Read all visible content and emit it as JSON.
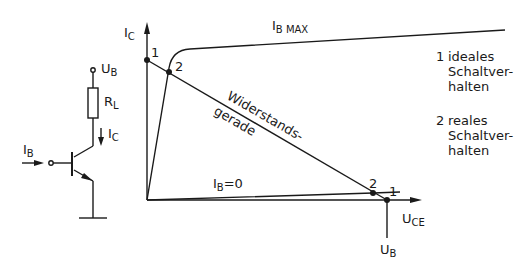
{
  "circuit": {
    "supply_label": "U",
    "supply_sub": "B",
    "resistor_label": "R",
    "resistor_sub": "L",
    "collector_current_label": "I",
    "collector_current_sub": "C",
    "base_current_label": "I",
    "base_current_sub": "B"
  },
  "graph": {
    "y_axis_label": "I",
    "y_axis_sub": "C",
    "x_axis_label": "U",
    "x_axis_sub": "CE",
    "x_marker_label": "U",
    "x_marker_sub": "B",
    "curve_max_label": "I",
    "curve_max_sub": "B MAX",
    "curve_zero_label": "I",
    "curve_zero_sub": "B",
    "curve_zero_suffix": "=0",
    "load_line_label_1": "Widerstands-",
    "load_line_label_2": "gerade",
    "point_upper_ideal": "1",
    "point_upper_real": "2",
    "point_lower_ideal": "1",
    "point_lower_real": "2"
  },
  "legend": {
    "items": [
      {
        "num": "1",
        "line1": "ideales",
        "line2": "Schaltver-",
        "line3": "halten"
      },
      {
        "num": "2",
        "line1": "reales",
        "line2": "Schaltver-",
        "line3": "halten"
      }
    ]
  },
  "colors": {
    "ink": "#1a1a1a",
    "background": "#ffffff"
  }
}
